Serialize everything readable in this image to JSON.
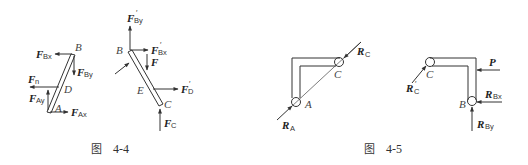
{
  "figures": [
    {
      "caption_prefix": "图",
      "caption_number": "4-4",
      "parts": [
        {
          "name": "bar-AB",
          "points": {
            "B": "B",
            "D": "D",
            "A": "A"
          },
          "forces": [
            {
              "symbol": "F",
              "sub": "Bx",
              "prime": ""
            },
            {
              "symbol": "F",
              "sub": "By",
              "prime": ""
            },
            {
              "symbol": "F",
              "sub": "n",
              "prime": ""
            },
            {
              "symbol": "F",
              "sub": "Ay",
              "prime": ""
            },
            {
              "symbol": "F",
              "sub": "Ax",
              "prime": ""
            }
          ]
        },
        {
          "name": "bar-BC",
          "points": {
            "B": "B",
            "E": "E",
            "C": "C"
          },
          "forces": [
            {
              "symbol": "F",
              "sub": "By",
              "prime": "′"
            },
            {
              "symbol": "F",
              "sub": "Bx",
              "prime": "′"
            },
            {
              "symbol": "F",
              "sub": "",
              "prime": ""
            },
            {
              "symbol": "F",
              "sub": "D",
              "prime": "′"
            },
            {
              "symbol": "F",
              "sub": "C",
              "prime": ""
            }
          ]
        }
      ]
    },
    {
      "caption_prefix": "图",
      "caption_number": "4-5",
      "parts": [
        {
          "name": "frame-AC",
          "points": {
            "A": "A",
            "C": "C"
          },
          "forces": [
            {
              "symbol": "R",
              "sub": "C",
              "prime": ""
            },
            {
              "symbol": "R",
              "sub": "A",
              "prime": ""
            }
          ]
        },
        {
          "name": "frame-CB",
          "points": {
            "C": "C",
            "B": "B"
          },
          "forces": [
            {
              "symbol": "P",
              "sub": "",
              "prime": ""
            },
            {
              "symbol": "R",
              "sub": "C",
              "prime": "′"
            },
            {
              "symbol": "R",
              "sub": "Bx",
              "prime": ""
            },
            {
              "symbol": "R",
              "sub": "By",
              "prime": ""
            }
          ]
        }
      ]
    }
  ],
  "colors": {
    "line": "#333333",
    "text": "#222222",
    "background": "#ffffff"
  }
}
